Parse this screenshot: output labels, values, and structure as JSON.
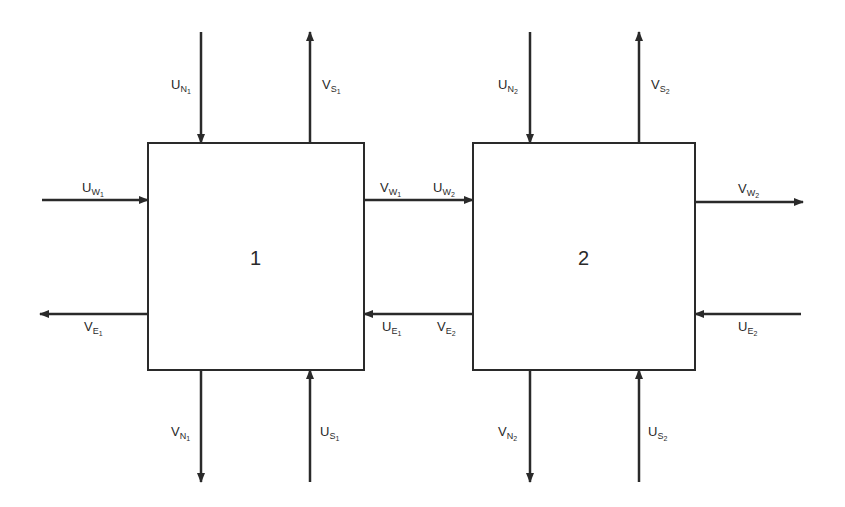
{
  "diagram": {
    "type": "two-cell flux exchange diagram",
    "colors": {
      "stroke": "#2a2a2a",
      "background": "#ffffff"
    },
    "boxes": [
      {
        "id": "1",
        "label": "1"
      },
      {
        "id": "2",
        "label": "2"
      }
    ],
    "labels": {
      "UN1": {
        "main": "U",
        "sub": "N",
        "subsub": "1"
      },
      "VS1": {
        "main": "V",
        "sub": "S",
        "subsub": "1"
      },
      "UW1": {
        "main": "U",
        "sub": "W",
        "subsub": "1"
      },
      "VE1": {
        "main": "V",
        "sub": "E",
        "subsub": "1"
      },
      "VW1": {
        "main": "V",
        "sub": "W",
        "subsub": "1"
      },
      "UE1": {
        "main": "U",
        "sub": "E",
        "subsub": "1"
      },
      "VN1": {
        "main": "V",
        "sub": "N",
        "subsub": "1"
      },
      "US1": {
        "main": "U",
        "sub": "S",
        "subsub": "1"
      },
      "UN2": {
        "main": "U",
        "sub": "N",
        "subsub": "2"
      },
      "VS2": {
        "main": "V",
        "sub": "S",
        "subsub": "2"
      },
      "UW2": {
        "main": "U",
        "sub": "W",
        "subsub": "2"
      },
      "VE2": {
        "main": "V",
        "sub": "E",
        "subsub": "2"
      },
      "VW2": {
        "main": "V",
        "sub": "W",
        "subsub": "2"
      },
      "UE2": {
        "main": "U",
        "sub": "E",
        "subsub": "2"
      },
      "VN2": {
        "main": "V",
        "sub": "N",
        "subsub": "2"
      },
      "US2": {
        "main": "U",
        "sub": "S",
        "subsub": "2"
      }
    }
  }
}
